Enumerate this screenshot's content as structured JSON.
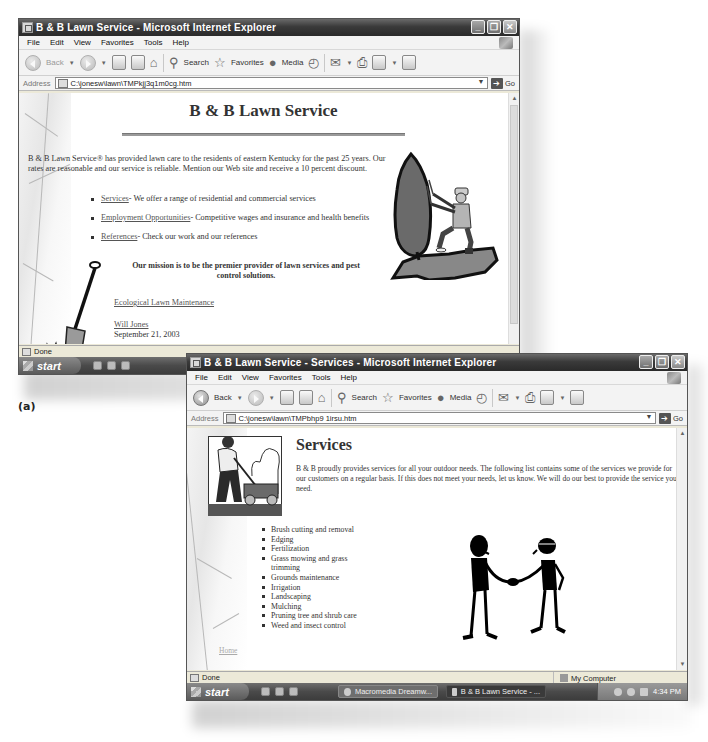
{
  "caption": "(a)",
  "window1": {
    "title": "B & B Lawn Service - Microsoft Internet Explorer",
    "window_controls": [
      "minimize",
      "restore",
      "close"
    ],
    "menu": [
      "File",
      "Edit",
      "View",
      "Favorites",
      "Tools",
      "Help"
    ],
    "toolbar": {
      "back": "Back",
      "search": "Search",
      "favorites": "Favorites",
      "media": "Media"
    },
    "address_label": "Address",
    "address_value": "C:\\jonesw\\lawn\\TMPkjj3q1m0cg.htm",
    "go_label": "Go",
    "page": {
      "heading": "B & B Lawn Service",
      "intro": "B & B Lawn Service® has provided lawn care to the residents of eastern Kentucky for the past 25 years. Our rates are reasonable and our service is reliable. Mention our Web site and receive a 10 percent discount.",
      "links": [
        {
          "label": "Services",
          "desc": " - We offer a range of residential and commercial services"
        },
        {
          "label": "Employment Opportunities",
          "desc": " - Competitive wages and insurance and health benefits"
        },
        {
          "label": "References",
          "desc": " - Check our work and our references"
        }
      ],
      "mission": "Our mission is to be the premier provider of lawn services and pest control solutions.",
      "eco_link": "Ecological Lawn Maintenance",
      "author": "Will Jones",
      "date": "September 21, 2003"
    },
    "status": "Done",
    "taskbar": {
      "start": "start"
    }
  },
  "window2": {
    "title": "B & B Lawn Service - Services - Microsoft Internet Explorer",
    "window_controls": [
      "minimize",
      "restore",
      "close"
    ],
    "menu": [
      "File",
      "Edit",
      "View",
      "Favorites",
      "Tools",
      "Help"
    ],
    "toolbar": {
      "back": "Back",
      "search": "Search",
      "favorites": "Favorites",
      "media": "Media"
    },
    "address_label": "Address",
    "address_value": "C:\\jonesw\\lawn\\TMPbhp9 1irsu.htm",
    "go_label": "Go",
    "page": {
      "heading": "Services",
      "intro": "B & B proudly provides services for all your outdoor needs. The following list contains some of the services we provide for our customers on a regular basis. If this does not meet your needs, let us know. We will do our best to provide the service you need.",
      "services": [
        "Brush cutting and removal",
        "Edging",
        "Fertilization",
        "Grass mowing and grass trimming",
        "Grounds maintenance",
        "Irrigation",
        "Landscaping",
        "Mulching",
        "Pruning tree and shrub care",
        "Weed and insect control"
      ],
      "home_link": "Home"
    },
    "status": "Done",
    "status_zone": "My Computer",
    "taskbar": {
      "start": "start",
      "tasks": [
        "Macromedia Dreamw...",
        "B & B Lawn Service - ..."
      ],
      "clock": "4:34 PM"
    }
  }
}
